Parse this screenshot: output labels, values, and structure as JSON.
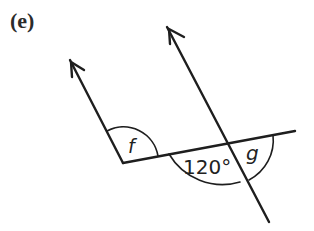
{
  "part_label": "(e)",
  "angles": {
    "f": "f",
    "given": "120°",
    "g": "g"
  },
  "colors": {
    "stroke": "#1e1e1e",
    "background": "#ffffff"
  }
}
